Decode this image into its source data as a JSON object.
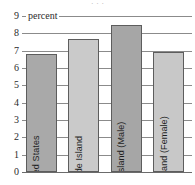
{
  "chart_data": {
    "type": "bar",
    "title": "",
    "xlabel": "",
    "ylabel": "percent",
    "unit_label": "percent",
    "ylim": [
      0,
      9
    ],
    "ytick_step": 1,
    "yticks": [
      "9",
      "8",
      "7",
      "6",
      "5",
      "4",
      "3",
      "2",
      "1",
      "0"
    ],
    "grid": true,
    "legend": "none",
    "categories": [
      "United States",
      "Rhode Island",
      "Rhode Island (Male)",
      "Rhode Island (Female)"
    ],
    "values": [
      6.8,
      7.65,
      8.5,
      6.95
    ],
    "bar_colors": [
      "#a9a9a9",
      "#cacaca",
      "#a6a6a6",
      "#c8c8c8"
    ],
    "bar_border_color": "#5d5d5d",
    "gridline_color": "#8b8b8b",
    "axis_color": "#6b6b6b",
    "background": "#ffffff",
    "text_color": "#1f1f1f"
  },
  "chart": {
    "title_remnant": "· · ·",
    "bars": [
      {
        "label": "United States",
        "value": 6.8,
        "color": "#a9a9a9"
      },
      {
        "label": "Rhode Island",
        "value": 7.65,
        "color": "#cacaca"
      },
      {
        "label": "Rhode Island (Male)",
        "value": 8.5,
        "color": "#a6a6a6"
      },
      {
        "label": "Rhode Island (Female)",
        "value": 6.95,
        "color": "#c8c8c8"
      }
    ],
    "unit_label": "percent",
    "yticks": [
      "9",
      "8",
      "7",
      "6",
      "5",
      "4",
      "3",
      "2",
      "1",
      "0"
    ]
  }
}
